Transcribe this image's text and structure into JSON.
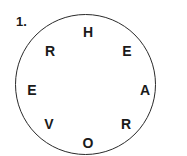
{
  "puzzle": {
    "number": "1.",
    "letters": [
      {
        "char": "H",
        "x": 88,
        "y": 32
      },
      {
        "char": "E",
        "x": 127,
        "y": 51
      },
      {
        "char": "A",
        "x": 145,
        "y": 90
      },
      {
        "char": "R",
        "x": 126,
        "y": 124
      },
      {
        "char": "O",
        "x": 88,
        "y": 143
      },
      {
        "char": "V",
        "x": 49,
        "y": 124
      },
      {
        "char": "E",
        "x": 32,
        "y": 90
      },
      {
        "char": "R",
        "x": 50,
        "y": 51
      }
    ]
  }
}
